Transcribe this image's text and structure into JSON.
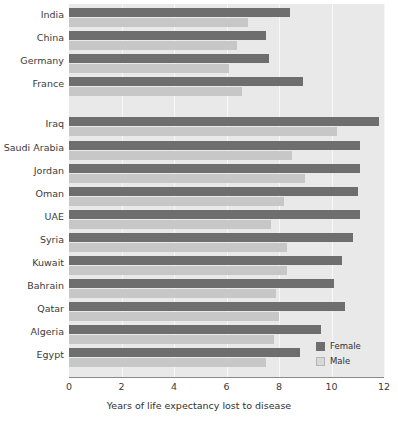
{
  "chart_data": {
    "type": "bar",
    "orientation": "horizontal",
    "title": "",
    "xlabel": "Years of life expectancy lost to disease",
    "ylabel": "",
    "xlim": [
      0,
      12
    ],
    "xticks": [
      0,
      2,
      4,
      6,
      8,
      10,
      12
    ],
    "xtick_labels": [
      "0",
      "2",
      "4",
      "6",
      "8",
      "10",
      "12"
    ],
    "grid": true,
    "grid_axis": "x",
    "legend_position": "lower right",
    "categories": [
      "India",
      "China",
      "Germany",
      "France",
      "Iraq",
      "Saudi Arabia",
      "Jordan",
      "Oman",
      "UAE",
      "Syria",
      "Kuwait",
      "Bahrain",
      "Qatar",
      "Algeria",
      "Egypt"
    ],
    "group_gap_after": 3,
    "series": [
      {
        "name": "Female",
        "color": "#6e6e6e",
        "values": [
          8.4,
          7.5,
          7.6,
          8.9,
          11.8,
          11.1,
          11.1,
          11.0,
          11.1,
          10.8,
          10.4,
          10.1,
          10.5,
          9.6,
          8.8
        ]
      },
      {
        "name": "Male",
        "color": "#c7c7c7",
        "values": [
          6.8,
          6.4,
          6.1,
          6.6,
          10.2,
          8.5,
          9.0,
          8.2,
          7.7,
          8.3,
          8.3,
          7.9,
          8.0,
          7.8,
          7.5
        ]
      }
    ]
  },
  "legend": {
    "items": [
      {
        "label": "Female",
        "swatch": "female"
      },
      {
        "label": "Male",
        "swatch": "male"
      }
    ]
  },
  "colors": {
    "female": "#6e6e6e",
    "male": "#c7c7c7",
    "plot_background": "#e9e9e9",
    "gridline": "#f7f7f7",
    "axis": "#8a8a8a",
    "text": "#3b3b3b"
  }
}
